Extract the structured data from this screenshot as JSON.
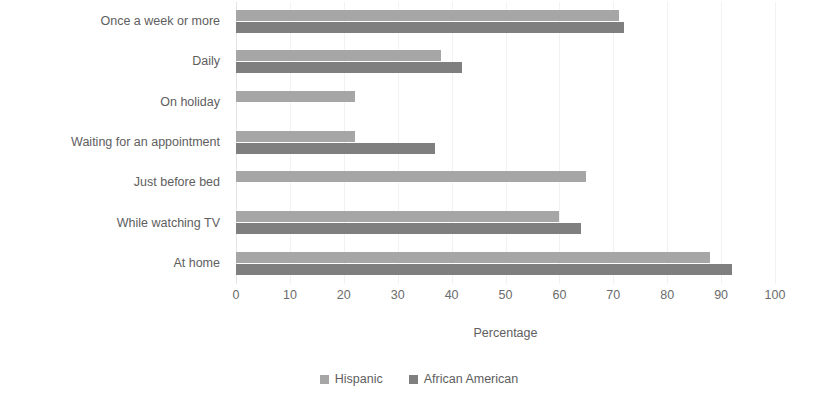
{
  "chart_data": {
    "type": "bar",
    "orientation": "horizontal",
    "title": "",
    "xlabel": "Percentage",
    "ylabel": "",
    "xlim": [
      0,
      100
    ],
    "xticks": [
      0,
      10,
      20,
      30,
      40,
      50,
      60,
      70,
      80,
      90,
      100
    ],
    "grid": true,
    "legend_position": "bottom",
    "categories": [
      "Once a week or more",
      "Daily",
      "On holiday",
      "Waiting for an appointment",
      "Just before bed",
      "While watching TV",
      "At home"
    ],
    "series": [
      {
        "name": "Hispanic",
        "color": "#a6a6a6",
        "values": [
          71,
          38,
          22,
          22,
          65,
          60,
          88
        ]
      },
      {
        "name": "African American",
        "color": "#7f7f7f",
        "values": [
          72,
          42,
          0,
          37,
          0,
          64,
          92
        ]
      }
    ]
  },
  "legend": {
    "items": [
      {
        "label": "Hispanic",
        "color": "#a6a6a6",
        "marker": "square-swatch-icon"
      },
      {
        "label": "African American",
        "color": "#7f7f7f",
        "marker": "square-swatch-icon"
      }
    ]
  }
}
